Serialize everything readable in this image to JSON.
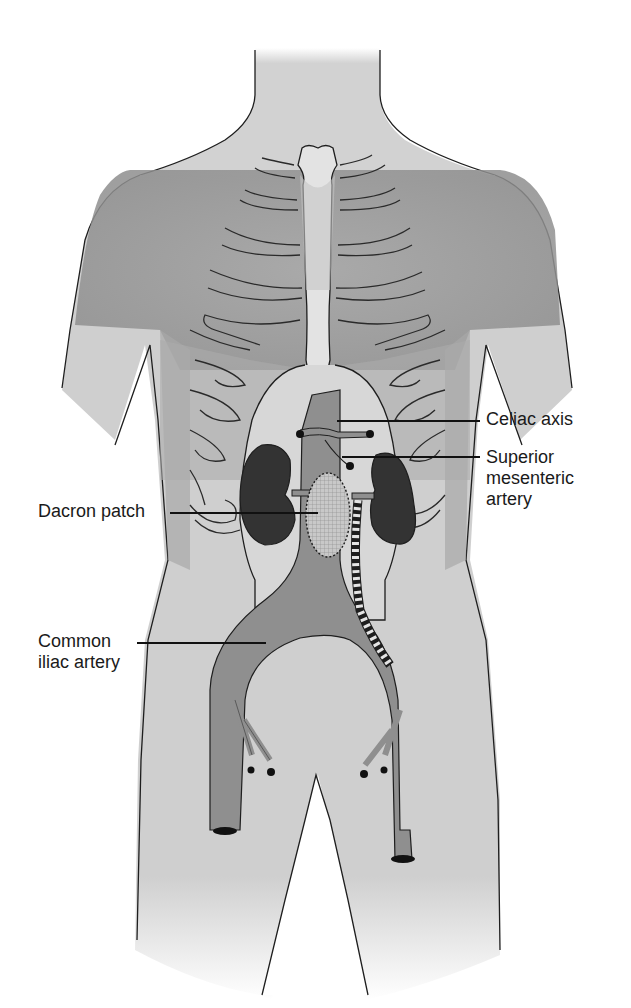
{
  "diagram": {
    "colors": {
      "skin": "#cfcfcf",
      "skin_light": "#dcdcdc",
      "chest_shadow": "#9a9a9a",
      "sternum": "#e6e6e6",
      "aorta": "#8f8f8f",
      "kidney": "#333333",
      "outline": "#1e1e1e",
      "label_text": "#1a1a1a",
      "background": "#ffffff"
    },
    "labels": [
      {
        "id": "celiac-axis",
        "text": "Celiac axis",
        "side": "right"
      },
      {
        "id": "superior-mesenteric-artery",
        "text": "Superior\nmesenteric\nartery",
        "side": "right"
      },
      {
        "id": "dacron-patch",
        "text": "Dacron patch",
        "side": "left"
      },
      {
        "id": "common-iliac-artery",
        "text": "Common\niliac artery",
        "side": "left"
      }
    ]
  }
}
